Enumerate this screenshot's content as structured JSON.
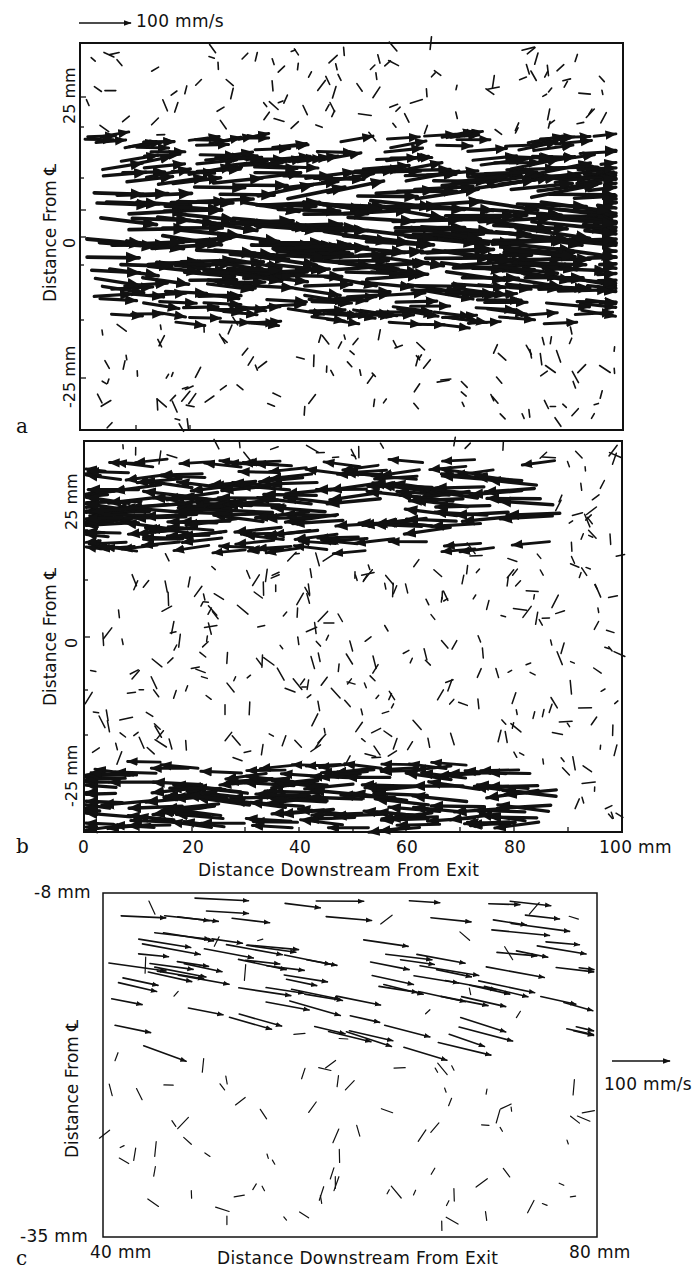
{
  "figure": {
    "scale_top": {
      "label": "100 mm/s"
    },
    "scale_c": {
      "label": "100 mm/s"
    },
    "panels": [
      {
        "id": "a",
        "letter": "a",
        "ylabel": "Distance From ℄",
        "yticks": [
          "25 mm",
          "0",
          "-25 mm"
        ],
        "flow": "rightward jet core, sparse small vectors at edges"
      },
      {
        "id": "b",
        "letter": "b",
        "ylabel": "Distance From ℄",
        "yticks": [
          "25 mm",
          "0",
          "-25 mm"
        ],
        "xticks": [
          "0",
          "20",
          "40",
          "60",
          "80",
          "100 mm"
        ],
        "xlabel": "Distance Downstream From Exit",
        "flow": "leftward vectors near top and bottom, sparse small vectors in center"
      },
      {
        "id": "c",
        "letter": "c",
        "ylabel": "Distance From ℄",
        "ytop": "-8 mm",
        "ybottom": "-35 mm",
        "xleft": "40 mm",
        "xright": "80 mm",
        "xlabel": "Distance Downstream From Exit",
        "flow": "rightward/downward-sloping vectors in upper half, sparse small vectors below"
      }
    ]
  },
  "chart_data": [
    {
      "type": "scatter",
      "title": "a",
      "subtype": "velocity vector field",
      "xlabel": "Distance Downstream From Exit",
      "ylabel": "Distance From Centerline",
      "xlim": [
        0,
        100
      ],
      "ylim": [
        -35,
        35
      ],
      "xunit": "mm",
      "yunit": "mm",
      "ytick_labels": [
        "25 mm",
        "0",
        "-25 mm"
      ],
      "scale_vector": "100 mm/s",
      "description": "Strong rightward (downstream) vectors concentrated between about -20 mm and +15 mm; weak, randomly oriented short vectors near +25 mm and below -25 mm."
    },
    {
      "type": "scatter",
      "title": "b",
      "subtype": "velocity vector field",
      "xlabel": "Distance Downstream From Exit",
      "ylabel": "Distance From Centerline",
      "xlim": [
        0,
        100
      ],
      "ylim": [
        -35,
        35
      ],
      "xtick_labels": [
        "0",
        "20",
        "40",
        "60",
        "80",
        "100 mm"
      ],
      "ytick_labels": [
        "25 mm",
        "0",
        "-25 mm"
      ],
      "description": "Strong leftward (upstream) vectors in bands near +25 mm and -25 mm; central region filled with small, weak randomly oriented vectors."
    },
    {
      "type": "scatter",
      "title": "c",
      "subtype": "velocity vector field",
      "xlabel": "Distance Downstream From Exit",
      "ylabel": "Distance From Centerline",
      "xlim": [
        40,
        80
      ],
      "ylim": [
        -35,
        -8
      ],
      "xtick_labels": [
        "40 mm",
        "80 mm"
      ],
      "ytick_labels": [
        "-8 mm",
        "-35 mm"
      ],
      "scale_vector": "100 mm/s",
      "description": "Rightward vectors near -8 mm, tilting downward with depth; sparse short vectors near the bottom."
    }
  ]
}
